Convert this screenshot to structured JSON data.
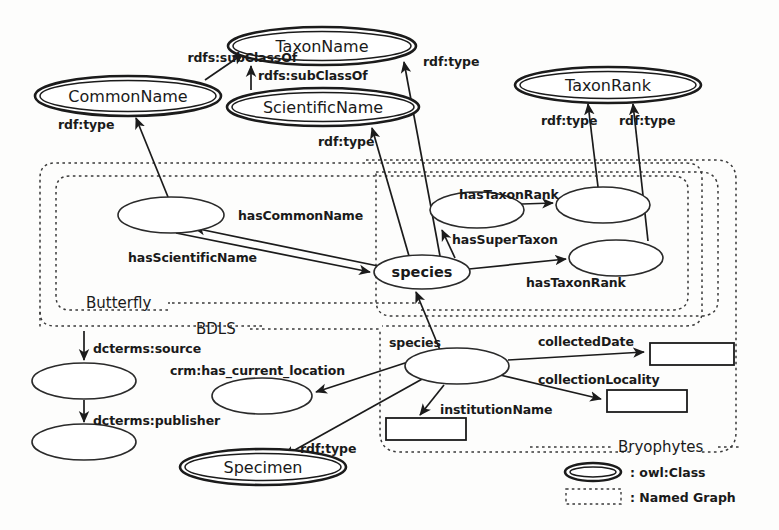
{
  "diagram": {
    "colors": {
      "stroke": "#1b1b1b",
      "background": "#ffffff",
      "dashed_stroke": "#3a3a3a"
    },
    "classes": [
      {
        "id": "commonName",
        "label": "CommonName",
        "cx": 128,
        "cy": 96,
        "rx": 93,
        "ry": 20
      },
      {
        "id": "taxonName",
        "label": "TaxonName",
        "cx": 322,
        "cy": 46,
        "rx": 94,
        "ry": 19
      },
      {
        "id": "scientificName",
        "label": "ScientificName",
        "cx": 323,
        "cy": 107,
        "rx": 96,
        "ry": 19
      },
      {
        "id": "taxonRank",
        "label": "TaxonRank",
        "cx": 608,
        "cy": 85,
        "rx": 93,
        "ry": 18
      },
      {
        "id": "specimen",
        "label": "Specimen",
        "cx": 263,
        "cy": 467,
        "rx": 83,
        "ry": 18
      }
    ],
    "blank_nodes": [
      {
        "id": "bnCommon",
        "label": "",
        "cx": 171,
        "cy": 215,
        "rx": 53,
        "ry": 18
      },
      {
        "id": "bnSpecies",
        "label": "species",
        "cx": 422,
        "cy": 272,
        "rx": 48,
        "ry": 17
      },
      {
        "id": "bnSuper",
        "label": "",
        "cx": 477,
        "cy": 210,
        "rx": 47,
        "ry": 18
      },
      {
        "id": "bnRank1",
        "label": "",
        "cx": 603,
        "cy": 205,
        "rx": 47,
        "ry": 18
      },
      {
        "id": "bnRank2",
        "label": "",
        "cx": 616,
        "cy": 258,
        "rx": 47,
        "ry": 18
      },
      {
        "id": "bnSource",
        "label": "",
        "cx": 84,
        "cy": 381,
        "rx": 52,
        "ry": 18
      },
      {
        "id": "bnPublish",
        "label": "",
        "cx": 84,
        "cy": 442,
        "rx": 52,
        "ry": 18
      },
      {
        "id": "bnLocation",
        "label": "",
        "cx": 262,
        "cy": 396,
        "rx": 50,
        "ry": 18
      },
      {
        "id": "bnBryo",
        "label": "",
        "cx": 457,
        "cy": 366,
        "rx": 52,
        "ry": 18
      }
    ],
    "literals": [
      {
        "id": "litDate",
        "x": 650,
        "y": 343,
        "w": 84,
        "h": 22
      },
      {
        "id": "litLocality",
        "x": 607,
        "y": 390,
        "w": 80,
        "h": 22
      },
      {
        "id": "litInstitution",
        "x": 386,
        "y": 418,
        "w": 80,
        "h": 22
      }
    ],
    "named_graphs": [
      {
        "id": "ngBryophytes",
        "label": "Bryophytes",
        "label_x": 664,
        "label_y": 450
      },
      {
        "id": "ngBDLS",
        "label": "BDLS",
        "label_x": 218,
        "label_y": 334
      },
      {
        "id": "ngButterfly",
        "label": "Butterfly",
        "label_x": 124,
        "label_y": 301
      }
    ],
    "edges": [
      {
        "id": "e1",
        "label": "rdfs:subClassOf",
        "label_x": 297,
        "label_y": 62,
        "from": "commonName",
        "to": "taxonName"
      },
      {
        "id": "e2",
        "label": "rdfs:subClassOf",
        "label_x": 334,
        "label_y": 77,
        "from": "scientificName",
        "to": "taxonName"
      },
      {
        "id": "e3",
        "label": "rdf:type",
        "label_x": 107,
        "label_y": 126,
        "from": "bnCommon",
        "to": "commonName"
      },
      {
        "id": "e4",
        "label": "rdf:type",
        "label_x": 355,
        "label_y": 146,
        "from": "bnSpecies",
        "to": "scientificName"
      },
      {
        "id": "e5",
        "label": "rdf:type",
        "label_x": 449,
        "label_y": 66,
        "from": "bnSpecies",
        "to": "taxonName"
      },
      {
        "id": "e6",
        "label": "rdf:type",
        "label_x": 562,
        "label_y": 122,
        "from": "bnRank1",
        "to": "taxonRank"
      },
      {
        "id": "e7",
        "label": "rdf:type",
        "label_x": 638,
        "label_y": 122,
        "from": "bnRank2",
        "to": "taxonRank"
      },
      {
        "id": "e8",
        "label": "hasCommonName",
        "label_x": 240,
        "label_y": 219,
        "from": "bnSpecies",
        "to": "bnCommon"
      },
      {
        "id": "e9",
        "label": "hasScientificName",
        "label_x": 128,
        "label_y": 261,
        "from": "bnCommon",
        "to": "bnSpecies"
      },
      {
        "id": "e10",
        "label": "hasTaxonRank",
        "label_x": 459,
        "label_y": 199,
        "from": "bnSuper",
        "to": "bnRank1"
      },
      {
        "id": "e11",
        "label": "hasSuperTaxon",
        "label_x": 453,
        "label_y": 243,
        "from": "bnSpecies",
        "to": "bnSuper"
      },
      {
        "id": "e12",
        "label": "hasTaxonRank",
        "label_x": 528,
        "label_y": 285,
        "from": "bnSpecies",
        "to": "bnRank2"
      },
      {
        "id": "e13",
        "label": "species",
        "label_x": 389,
        "label_y": 345,
        "from": "bnBryo",
        "to": "bnSpecies"
      },
      {
        "id": "e14",
        "label": "dcterms:source",
        "label_x": 93,
        "label_y": 352,
        "from": "ngBDLS",
        "to": "bnSource"
      },
      {
        "id": "e15",
        "label": "dcterms:publisher",
        "label_x": 93,
        "label_y": 424,
        "from": "bnSource",
        "to": "bnPublish"
      },
      {
        "id": "e16",
        "label": "crm:has_current_location",
        "label_x": 172,
        "label_y": 374,
        "from": "bnBryo",
        "to": "bnLocation"
      },
      {
        "id": "e17",
        "label": "rdf:type",
        "label_x": 302,
        "label_y": 451,
        "from": "bnBryo",
        "to": "specimen"
      },
      {
        "id": "e18",
        "label": "collectedDate",
        "label_x": 539,
        "label_y": 345,
        "from": "bnBryo",
        "to": "litDate"
      },
      {
        "id": "e19",
        "label": "collectionLocality",
        "label_x": 540,
        "label_y": 383,
        "from": "bnBryo",
        "to": "litLocality"
      },
      {
        "id": "e20",
        "label": "institutionName",
        "label_x": 442,
        "label_y": 413,
        "from": "bnBryo",
        "to": "litInstitution"
      }
    ],
    "legend": {
      "items": [
        {
          "id": "legendClass",
          "symbol": "double-ellipse",
          "label": ": owl:Class"
        },
        {
          "id": "legendGraph",
          "symbol": "dashed-rectangle",
          "label": ": Named Graph"
        }
      ]
    }
  }
}
